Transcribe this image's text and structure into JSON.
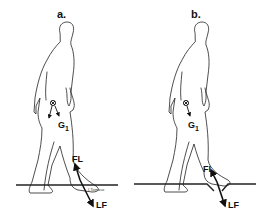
{
  "figure": {
    "panels": [
      {
        "id": "a",
        "label": "a.",
        "center_of_mass_label": "G",
        "center_of_mass_subscript": "1",
        "foot_force_label": "FL",
        "ground_reaction_label": "LF",
        "ground_type": "flat",
        "signature": "I.Tomaso"
      },
      {
        "id": "b",
        "label": "b.",
        "center_of_mass_label": "G",
        "center_of_mass_subscript": "1",
        "foot_force_label": "FL",
        "ground_type": "depression",
        "ground_reaction_label": "LF"
      }
    ],
    "colors": {
      "ink": "#111111",
      "background": "#ffffff"
    }
  }
}
